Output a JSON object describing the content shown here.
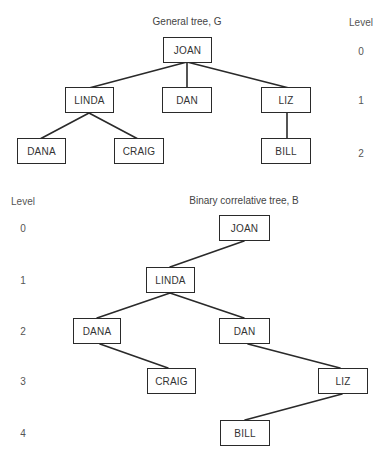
{
  "general_tree": {
    "title": "General tree, G",
    "level_header": "Level",
    "levels": [
      "0",
      "1",
      "2"
    ],
    "nodes": {
      "joan": "JOAN",
      "linda": "LINDA",
      "dan": "DAN",
      "liz": "LIZ",
      "dana": "DANA",
      "craig": "CRAIG",
      "bill": "BILL"
    },
    "edges": [
      [
        "JOAN",
        "LINDA"
      ],
      [
        "JOAN",
        "DAN"
      ],
      [
        "JOAN",
        "LIZ"
      ],
      [
        "LINDA",
        "DANA"
      ],
      [
        "LINDA",
        "CRAIG"
      ],
      [
        "LIZ",
        "BILL"
      ]
    ]
  },
  "binary_tree": {
    "title": "Binary correlative tree, B",
    "level_header": "Level",
    "levels": [
      "0",
      "1",
      "2",
      "3",
      "4"
    ],
    "nodes": {
      "joan": "JOAN",
      "linda": "LINDA",
      "dana": "DANA",
      "dan": "DAN",
      "craig": "CRAIG",
      "liz": "LIZ",
      "bill": "BILL"
    },
    "edges": [
      [
        "JOAN",
        "LINDA"
      ],
      [
        "LINDA",
        "DANA"
      ],
      [
        "LINDA",
        "DAN"
      ],
      [
        "DANA",
        "CRAIG"
      ],
      [
        "DAN",
        "LIZ"
      ],
      [
        "LIZ",
        "BILL"
      ]
    ]
  },
  "colors": {
    "line": "#2a2a2a",
    "text": "#333333",
    "background": "#ffffff"
  }
}
